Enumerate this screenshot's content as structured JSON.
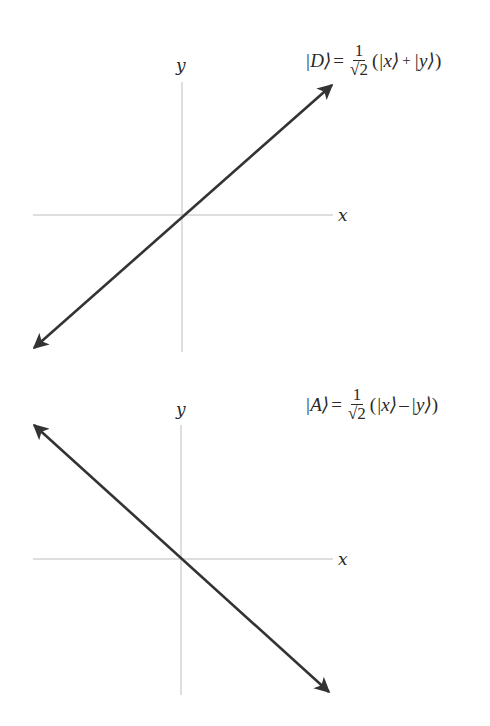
{
  "figures": [
    {
      "id": "diagonal",
      "axis_labels": {
        "x": "x",
        "y": "y"
      },
      "equation": {
        "ket": "|D⟩",
        "equals": "=",
        "fraction_numerator": "1",
        "fraction_denominator": "√2",
        "open": "(",
        "term1": "|x⟩",
        "operator": "+",
        "term2": "|y⟩",
        "close": ")"
      },
      "vector": {
        "from": [
          32,
          350
        ],
        "to": [
          334,
          83
        ],
        "description": "double-headed arrow at +45 degrees"
      }
    },
    {
      "id": "antidiagonal",
      "axis_labels": {
        "x": "x",
        "y": "y"
      },
      "equation": {
        "ket": "|A⟩",
        "equals": "=",
        "fraction_numerator": "1",
        "fraction_denominator": "√2",
        "open": "(",
        "term1": "|x⟩",
        "operator": "–",
        "term2": "|y⟩",
        "close": ")"
      },
      "vector": {
        "from": [
          32,
          423
        ],
        "to": [
          331,
          694
        ],
        "description": "double-headed arrow at -45 degrees"
      }
    }
  ],
  "colors": {
    "axis": "#bdbdbd",
    "arrow": "#333333",
    "text": "#2a2a2a"
  }
}
